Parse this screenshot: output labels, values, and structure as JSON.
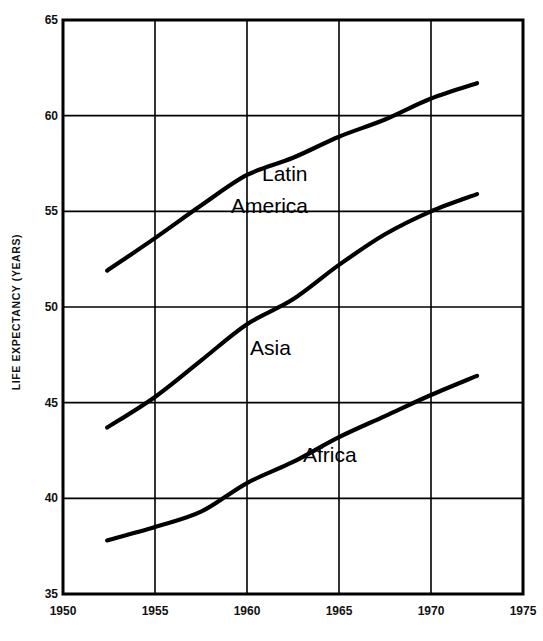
{
  "chart_data": {
    "type": "line",
    "title": "",
    "xlabel": "",
    "ylabel": "LIFE EXPECTANCY (YEARS)",
    "xlim": [
      1950,
      1975
    ],
    "ylim": [
      35,
      65
    ],
    "xticks": [
      "1950",
      "1955",
      "1960",
      "1965",
      "1970",
      "1975"
    ],
    "yticks": [
      "35",
      "40",
      "45",
      "50",
      "55",
      "60",
      "65"
    ],
    "grid": true,
    "legend_position": "inline-labels",
    "series": [
      {
        "name": "Latin America",
        "label_line1": "Latin",
        "label_line2": "America",
        "x": [
          1952.4,
          1955,
          1957.5,
          1960,
          1962.5,
          1965,
          1967.5,
          1970,
          1972.5
        ],
        "values": [
          51.9,
          53.6,
          55.3,
          56.9,
          57.8,
          58.9,
          59.8,
          60.9,
          61.7
        ]
      },
      {
        "name": "Asia",
        "label_line1": "Asia",
        "x": [
          1952.4,
          1955,
          1957.5,
          1960,
          1962.5,
          1965,
          1967.5,
          1970,
          1972.5
        ],
        "values": [
          43.7,
          45.3,
          47.2,
          49.1,
          50.4,
          52.2,
          53.8,
          55.0,
          55.9
        ]
      },
      {
        "name": "Africa",
        "label_line1": "Africa",
        "x": [
          1952.4,
          1955,
          1957.5,
          1960,
          1962.5,
          1965,
          1967.5,
          1970,
          1972.5
        ],
        "values": [
          37.8,
          38.5,
          39.3,
          40.8,
          41.9,
          43.2,
          44.3,
          45.4,
          46.4
        ]
      }
    ]
  },
  "axes": {
    "y_title": "LIFE EXPECTANCY (YEARS)"
  },
  "labels": {
    "latin": "Latin",
    "america": "America",
    "asia": "Asia",
    "africa": "Africa"
  },
  "colors": {
    "line": "#000000",
    "grid": "#000000",
    "background": "#ffffff",
    "text": "#111111"
  }
}
